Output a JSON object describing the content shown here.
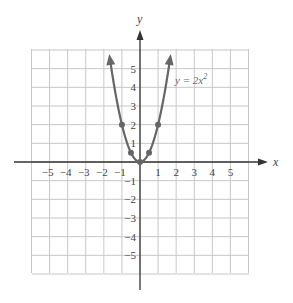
{
  "chart_data": {
    "type": "line",
    "title": "",
    "xlabel": "x",
    "ylabel": "y",
    "xlim": [
      -6,
      6
    ],
    "ylim": [
      -6,
      6
    ],
    "grid": true,
    "x_ticks": [
      -5,
      -4,
      -3,
      -2,
      -1,
      1,
      2,
      3,
      4,
      5
    ],
    "x_tick_labels": [
      "−5",
      "−4",
      "−3",
      "−2",
      "−1",
      "1",
      "2",
      "3",
      "4",
      "5"
    ],
    "y_ticks": [
      5,
      4,
      3,
      2,
      1,
      -1,
      -2,
      -3,
      -4,
      -5
    ],
    "y_tick_labels": [
      "5",
      "4",
      "3",
      "2",
      "1",
      "−1",
      "−2",
      "−3",
      "−4",
      "−5"
    ],
    "series": [
      {
        "name": "y = 2x²",
        "function": "2*x^2",
        "x_range": [
          -1.67,
          1.67
        ],
        "arrows_at_ends": true,
        "color": "#666666",
        "points": [
          {
            "x": -1,
            "y": 2
          },
          {
            "x": -0.5,
            "y": 0.5
          },
          {
            "x": 0,
            "y": 0
          },
          {
            "x": 0.5,
            "y": 0.5
          },
          {
            "x": 1,
            "y": 2
          }
        ]
      }
    ],
    "annotations": [
      {
        "text": "y = 2x",
        "superscript": "2",
        "x": 2.2,
        "y": 4.1
      }
    ]
  },
  "labels": {
    "x_axis": "x",
    "y_axis": "y",
    "equation_main": "y = 2x",
    "equation_sup": "2"
  }
}
